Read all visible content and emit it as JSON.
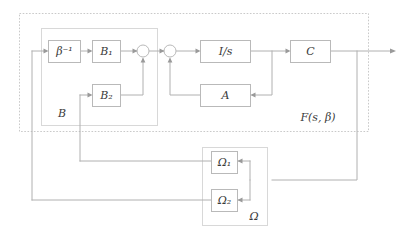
{
  "figure": {
    "kind": "control-system-block-diagram",
    "width": 409,
    "height": 238,
    "background": "#ffffff",
    "line_color": "#b0b0b0",
    "block_border_color": "#b9b9b9",
    "group_border_color": "#d8d8d8",
    "dashed_border_color": "#c9c9c9",
    "text_color": "#3a3a3a"
  },
  "blocks": {
    "beta_inverse": "β⁻¹",
    "b1": "B₁",
    "b2": "B₂",
    "integrator": "I/s",
    "a": "A",
    "c": "C",
    "omega1": "Ω₁",
    "omega2": "Ω₂"
  },
  "groups": {
    "b_group": "B",
    "f_group": "F(s, β)",
    "omega_group": "Ω"
  },
  "junctions": {
    "sum1": "sum-junction-1",
    "sum2": "sum-junction-2"
  },
  "icons": {
    "output_arrow": "arrow-right-icon",
    "input_arrow": "arrow-right-icon",
    "down_arrow": "arrow-down-icon",
    "left_arrow": "arrow-left-icon"
  }
}
